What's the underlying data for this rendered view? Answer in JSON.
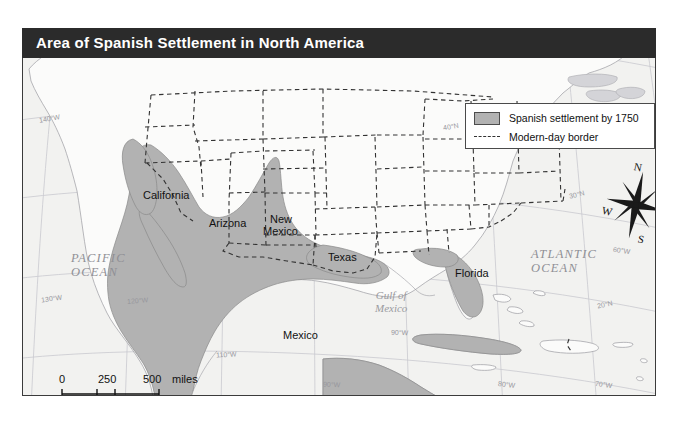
{
  "title": "Area of Spanish Settlement in North America",
  "legend": {
    "items": [
      {
        "label": "Spanish settlement by 1750",
        "symbol": "filled-swatch",
        "color": "#b2b2b2"
      },
      {
        "label": "Modern-day border",
        "symbol": "dashed-line",
        "color": "#333333"
      }
    ]
  },
  "compass": {
    "north": "N",
    "east": "E",
    "south": "S",
    "west": "W"
  },
  "scale": {
    "miles": {
      "ticks": [
        "0",
        "250",
        "500"
      ],
      "unit": "miles"
    },
    "kilometers": {
      "ticks": [
        "0",
        "250",
        "500"
      ],
      "unit": "kilometers"
    }
  },
  "places": [
    {
      "name": "California"
    },
    {
      "name": "Arizona"
    },
    {
      "name": "New"
    },
    {
      "name": "Mexico"
    },
    {
      "name": "Texas"
    },
    {
      "name": "Florida"
    },
    {
      "name": "Mexico"
    }
  ],
  "oceans": [
    {
      "line1": "PACIFIC",
      "line2": "OCEAN"
    },
    {
      "line1": "ATLANTIC",
      "line2": "OCEAN"
    }
  ],
  "seas": [
    {
      "line1": "Gulf of",
      "line2": "Mexico"
    }
  ],
  "graticule": {
    "labels": [
      "140°W",
      "130°W",
      "120°W",
      "110°W",
      "90°W",
      "80°W",
      "70°W",
      "60°W",
      "40°N",
      "30°N",
      "20°N"
    ]
  },
  "colors": {
    "title_bar": "#2b2b2b",
    "title_text": "#ffffff",
    "map_background": "#f2f2f0",
    "land_fill": "#fbfbfa",
    "settlement_fill": "#b2b2b2",
    "border_dash": "#333333",
    "frame": "#3b3b3b",
    "graticule_line": "#c9c9cf"
  }
}
